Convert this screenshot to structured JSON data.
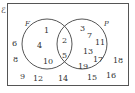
{
  "diagram": {
    "type": "venn",
    "universal_label": "ℰ",
    "sets": [
      {
        "name": "F",
        "label": "F"
      },
      {
        "name": "P",
        "label": "P"
      }
    ],
    "regions": {
      "F_only": [
        "1",
        "4",
        "10"
      ],
      "F_and_P": [
        "2",
        "5"
      ],
      "P_only": [
        "3",
        "7",
        "11",
        "13",
        "17",
        "19"
      ],
      "outside": [
        "6",
        "8",
        "9",
        "12",
        "14",
        "15",
        "16",
        "18"
      ]
    }
  },
  "labels": {
    "u": "ℰ",
    "F": "F",
    "P": "P",
    "n1": "1",
    "n2": "2",
    "n3": "3",
    "n4": "4",
    "n5": "5",
    "n6": "6",
    "n7": "7",
    "n8": "8",
    "n9": "9",
    "n10": "10",
    "n11": "11",
    "n12": "12",
    "n13": "13",
    "n14": "14",
    "n15": "15",
    "n16": "16",
    "n17": "17",
    "n18": "18",
    "n19": "19"
  }
}
